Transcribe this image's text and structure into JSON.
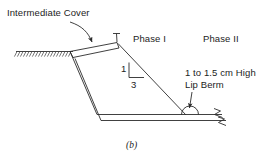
{
  "figure": {
    "caption": "(b)",
    "type": "engineering-cross-section"
  },
  "labels": {
    "intermediate_cover": "Intermediate Cover",
    "phase_one": "Phase I",
    "phase_two": "Phase II",
    "lip_berm_line1": "1 to 1.5 cm High",
    "lip_berm_line2": "Lip Berm"
  },
  "slope_ratio": {
    "rise": "1",
    "run": "3"
  },
  "colors": {
    "line": "#2b2b2b",
    "text": "#1c1c1c",
    "background": "#ffffff"
  },
  "icons": {
    "ground_hatch": "ground-surface-hatch",
    "break_mark": "line-break-mark",
    "leader_arrow": "leader-arrow"
  }
}
